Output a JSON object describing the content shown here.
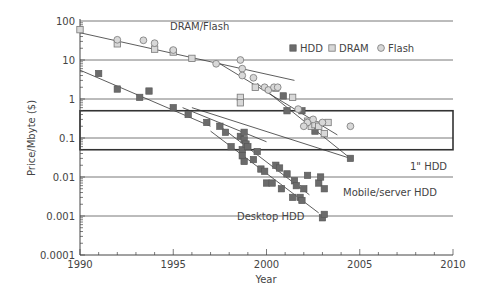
{
  "chart_data": {
    "type": "scatter",
    "title": "",
    "xlabel": "Year",
    "ylabel": "Price/Mbyte ($)",
    "xscale": "linear",
    "yscale": "log",
    "xlim": [
      1990,
      2010
    ],
    "ylim": [
      0.0001,
      100
    ],
    "x_ticks": [
      1990,
      1995,
      2000,
      2005,
      2010
    ],
    "x_tick_labels": [
      "1990",
      "1995",
      "2000",
      "2005",
      "2010"
    ],
    "y_ticks": [
      0.0001,
      0.001,
      0.01,
      0.1,
      1,
      10,
      100
    ],
    "y_tick_labels": [
      "0.0001",
      "0.001",
      "0.01",
      "0.1",
      "1",
      "10",
      "100"
    ],
    "grid": "horizontal lines at decades",
    "legend": {
      "position": "top-right",
      "entries": [
        {
          "label": "HDD",
          "marker": "filled-square",
          "color": "#6b6b6b"
        },
        {
          "label": "DRAM",
          "marker": "open-square",
          "color": "#c8c8c8"
        },
        {
          "label": "Flash",
          "marker": "circle",
          "color": "#c8c8c8"
        }
      ]
    },
    "highlight_band": {
      "x": [
        1990,
        2010
      ],
      "y": [
        0.05,
        0.5
      ]
    },
    "annotations": [
      {
        "text": "DRAM/Flash",
        "x": 1996.5,
        "y": 45
      },
      {
        "text": "1\" HDD",
        "x": 2005.2,
        "y": 0.022
      },
      {
        "text": "Mobile/server HDD",
        "x": 2003.3,
        "y": 0.006
      },
      {
        "text": "Desktop HDD",
        "x": 1999.9,
        "y": 0.0011
      }
    ],
    "series": [
      {
        "name": "HDD",
        "marker": "filled-square",
        "points": [
          [
            1991,
            4.5
          ],
          [
            1992,
            1.8
          ],
          [
            1993.2,
            1.1
          ],
          [
            1993.7,
            1.6
          ],
          [
            1995,
            0.6
          ],
          [
            1995.8,
            0.4
          ],
          [
            1996.8,
            0.25
          ],
          [
            1997.5,
            0.2
          ],
          [
            1997.8,
            0.14
          ],
          [
            1998.1,
            0.06
          ],
          [
            1998.6,
            0.11
          ],
          [
            1998.7,
            0.05
          ],
          [
            1998.8,
            0.14
          ],
          [
            1998.8,
            0.09
          ],
          [
            1998.9,
            0.07
          ],
          [
            1998.7,
            0.035
          ],
          [
            1998.8,
            0.025
          ],
          [
            1999.0,
            0.06
          ],
          [
            1999.3,
            0.028
          ],
          [
            1999.5,
            0.045
          ],
          [
            1999.7,
            0.016
          ],
          [
            1999.9,
            0.014
          ],
          [
            2000.0,
            0.007
          ],
          [
            2000.3,
            0.007
          ],
          [
            2000.5,
            0.02
          ],
          [
            2000.7,
            0.017
          ],
          [
            2000.8,
            0.005
          ],
          [
            2001.1,
            0.012
          ],
          [
            2001.4,
            0.003
          ],
          [
            2001.5,
            0.008
          ],
          [
            2001.6,
            0.006
          ],
          [
            2001.8,
            0.003
          ],
          [
            2001.9,
            0.0025
          ],
          [
            2002.0,
            0.005
          ],
          [
            2002.2,
            0.011
          ],
          [
            2002.8,
            0.007
          ],
          [
            2002.9,
            0.01
          ],
          [
            2003.1,
            0.005
          ],
          [
            2003.0,
            0.0009
          ],
          [
            2003.1,
            0.0011
          ],
          [
            2000.9,
            1.2
          ],
          [
            2001.1,
            0.5
          ],
          [
            2001.9,
            0.5
          ],
          [
            2002.6,
            0.15
          ],
          [
            2004.5,
            0.03
          ]
        ]
      },
      {
        "name": "DRAM",
        "marker": "open-square",
        "points": [
          [
            1990,
            60
          ],
          [
            1992,
            26
          ],
          [
            1994,
            19
          ],
          [
            1995,
            16
          ],
          [
            1996,
            11
          ],
          [
            1998.6,
            1.1
          ],
          [
            1998.6,
            0.8
          ],
          [
            1999.4,
            2.0
          ],
          [
            2000.5,
            1.9
          ],
          [
            2001.4,
            1.1
          ],
          [
            2002.2,
            0.27
          ],
          [
            2002.4,
            0.2
          ],
          [
            2002.6,
            0.22
          ],
          [
            2002.8,
            0.2
          ],
          [
            2003.1,
            0.13
          ],
          [
            2003.3,
            0.25
          ]
        ]
      },
      {
        "name": "Flash",
        "marker": "circle",
        "points": [
          [
            1992,
            33
          ],
          [
            1993.4,
            32
          ],
          [
            1994,
            27
          ],
          [
            1995,
            18
          ],
          [
            1997.3,
            8
          ],
          [
            1998.6,
            10
          ],
          [
            1998.7,
            6
          ],
          [
            1998.7,
            4
          ],
          [
            1999.3,
            3.5
          ],
          [
            1999.9,
            2.0
          ],
          [
            2000.1,
            1.7
          ],
          [
            2000.4,
            2.0
          ],
          [
            2000.6,
            2.0
          ],
          [
            2001.7,
            0.55
          ],
          [
            2002.2,
            0.25
          ],
          [
            2002.5,
            0.3
          ],
          [
            2003.0,
            0.25
          ],
          [
            2004.5,
            0.2
          ],
          [
            2002.0,
            0.2
          ]
        ]
      }
    ],
    "trend_lines": [
      {
        "name": "DRAM/Flash early",
        "from": [
          1990,
          50
        ],
        "to": [
          2001.5,
          3.0
        ]
      },
      {
        "name": "Flash",
        "from": [
          1997.5,
          8
        ],
        "to": [
          2003.8,
          0.12
        ]
      },
      {
        "name": "DRAM steep",
        "from": [
          1999.5,
          2.5
        ],
        "to": [
          2004.5,
          0.03
        ]
      },
      {
        "name": "HDD early",
        "from": [
          1990,
          5.5
        ],
        "to": [
          1997,
          0.2
        ]
      },
      {
        "name": "HDD mobile",
        "from": [
          1995.5,
          0.6
        ],
        "to": [
          2000,
          0.08
        ]
      },
      {
        "name": "HDD 1in",
        "from": [
          1996,
          0.6
        ],
        "to": [
          2004.5,
          0.03
        ]
      },
      {
        "name": "Mobile/server HDD",
        "from": [
          1997.5,
          0.2
        ],
        "to": [
          2002.3,
          0.0035
        ]
      },
      {
        "name": "Desktop HDD",
        "from": [
          1997,
          0.15
        ],
        "to": [
          2002.8,
          0.0012
        ]
      }
    ]
  }
}
